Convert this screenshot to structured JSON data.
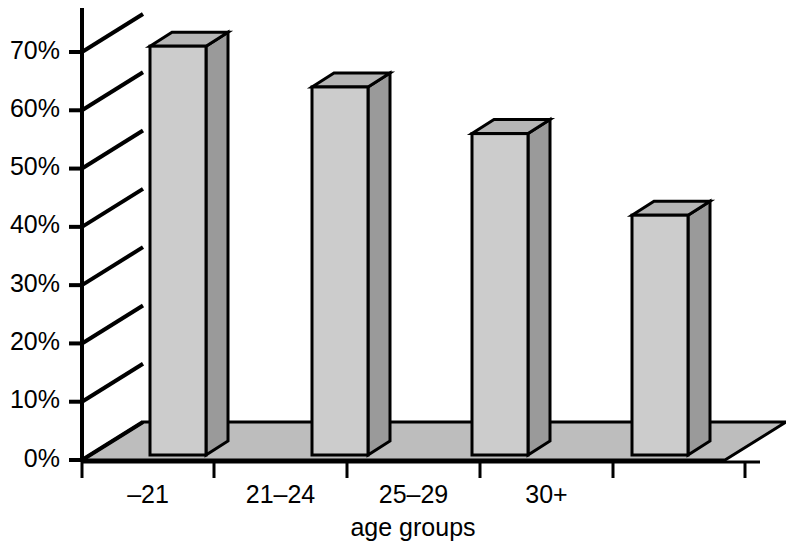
{
  "chart_data": {
    "type": "bar",
    "title": "",
    "subtitle": "",
    "xlabel": "age groups",
    "ylabel": "",
    "categories": [
      "–21",
      "21–24",
      "25–29",
      "30+"
    ],
    "values": [
      71,
      64,
      56,
      42
    ],
    "ylim": [
      0,
      70
    ],
    "y_tick_values": [
      70,
      60,
      50,
      40,
      30,
      20,
      10,
      0
    ],
    "y_tick_labels": [
      "70%",
      "60%",
      "50%",
      "40%",
      "30%",
      "20%",
      "10%",
      "0%"
    ],
    "grid": "diagonal-depth-lines",
    "legend": "none",
    "style": "3d-column",
    "colors": {
      "bar_front": "#cccccc",
      "bar_side": "#9a9a9a",
      "bar_top": "#b5b5b5",
      "floor": "#bdbdbd",
      "outline": "#000000",
      "background": "#ffffff"
    }
  },
  "axes": {
    "y_axis_name": "percentage-axis",
    "x_axis_name": "age-groups-axis"
  }
}
